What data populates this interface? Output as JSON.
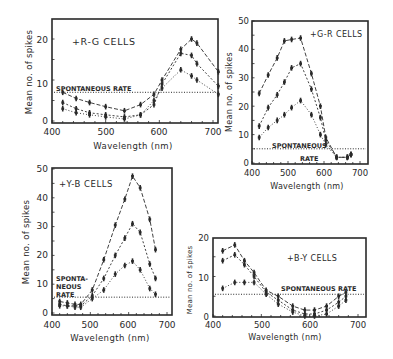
{
  "figure": {
    "panels_count": 4
  },
  "chart_data": [
    {
      "id": "rg",
      "type": "line",
      "title": "+R-G CELLS",
      "xlabel": "Wavelength (nm)",
      "ylabel": "Mean no. of spikes",
      "xlim": [
        400,
        715
      ],
      "ylim": [
        0,
        25
      ],
      "xticks": [
        400,
        500,
        600,
        700
      ],
      "yticks": [
        0,
        10,
        20
      ],
      "grid": false,
      "annotations": [
        "SPONTANEOUS RATE"
      ],
      "spontaneous_rate": 7,
      "x": [
        420,
        445,
        470,
        500,
        535,
        565,
        590,
        605,
        640,
        660,
        670,
        710
      ],
      "series": [
        {
          "name": "high",
          "values": [
            7,
            5.5,
            4.5,
            3.5,
            2.5,
            4,
            6.5,
            10,
            17.5,
            20,
            19,
            12
          ]
        },
        {
          "name": "mid",
          "values": [
            4.5,
            3,
            2,
            1.5,
            1,
            1.5,
            4,
            9,
            16.5,
            16,
            14,
            8.5
          ]
        },
        {
          "name": "low",
          "values": [
            3,
            2,
            1.5,
            1,
            0.5,
            1.5,
            5,
            8,
            12.5,
            11,
            10,
            6.5
          ]
        }
      ]
    },
    {
      "id": "gr",
      "type": "line",
      "title": "+G-R CELLS",
      "xlabel": "Wavelength (nm)",
      "ylabel": "Mean no. of spikes",
      "xlim": [
        400,
        710
      ],
      "ylim": [
        0,
        50
      ],
      "xticks": [
        400,
        500,
        600,
        700
      ],
      "yticks": [
        0,
        10,
        20,
        30,
        40,
        50
      ],
      "grid": false,
      "annotations": [
        "SPONTANEOUS",
        "RATE"
      ],
      "spontaneous_rate": 5,
      "x": [
        420,
        445,
        470,
        490,
        510,
        535,
        565,
        590,
        605,
        635,
        665,
        675
      ],
      "series": [
        {
          "name": "high",
          "values": [
            24.5,
            31,
            37,
            43,
            43.5,
            44,
            31.5,
            20,
            9,
            2,
            2,
            3
          ]
        },
        {
          "name": "mid",
          "values": [
            13,
            19.5,
            24,
            28.5,
            33.5,
            35,
            26,
            16,
            8,
            2,
            2,
            3
          ]
        },
        {
          "name": "low",
          "values": [
            9,
            12.5,
            15,
            17,
            19.5,
            22,
            17,
            10,
            6.5,
            2,
            2,
            3
          ]
        }
      ]
    },
    {
      "id": "yb",
      "type": "line",
      "title": "+Y-B CELLS",
      "xlabel": "Wavelength (nm)",
      "ylabel": "Mean no. of spikes",
      "xlim": [
        400,
        715
      ],
      "ylim": [
        0,
        50
      ],
      "xticks": [
        400,
        500,
        600,
        700
      ],
      "yticks": [
        0,
        10,
        20,
        30,
        40,
        50
      ],
      "grid": false,
      "annotations": [
        "SPONTA-",
        "NEOUS",
        "RATE"
      ],
      "spontaneous_rate": 5.5,
      "x": [
        420,
        440,
        460,
        475,
        505,
        535,
        565,
        590,
        610,
        630,
        655,
        670
      ],
      "series": [
        {
          "name": "high",
          "values": [
            4,
            3.5,
            3,
            3,
            8,
            18.5,
            30.5,
            39.5,
            47.5,
            43.5,
            32.5,
            22
          ]
        },
        {
          "name": "mid",
          "values": [
            3,
            2.5,
            2.5,
            2.5,
            6,
            12,
            20,
            26,
            31,
            28,
            17,
            12
          ]
        },
        {
          "name": "low",
          "values": [
            2.5,
            2.5,
            2,
            2,
            5,
            8,
            13.5,
            16.5,
            18,
            15,
            8.5,
            6.5
          ]
        }
      ]
    },
    {
      "id": "by",
      "type": "line",
      "title": "+B-Y CELLS",
      "xlabel": "Wavelength (nm)",
      "ylabel": "Mean no. of spikes",
      "xlim": [
        400,
        710
      ],
      "ylim": [
        0,
        20
      ],
      "xticks": [
        400,
        500,
        600,
        700
      ],
      "yticks": [
        0,
        10,
        20
      ],
      "grid": false,
      "annotations": [
        "SPONTANEOUS RATE"
      ],
      "spontaneous_rate": 5.5,
      "x": [
        420,
        445,
        465,
        485,
        510,
        535,
        565,
        590,
        610,
        635,
        660,
        675
      ],
      "series": [
        {
          "name": "high",
          "values": [
            16.5,
            18,
            14,
            11,
            6.5,
            5,
            2.5,
            1.5,
            1.5,
            2.5,
            5,
            6
          ]
        },
        {
          "name": "mid",
          "values": [
            14,
            15.5,
            13,
            10,
            6,
            4,
            1.5,
            0.5,
            0.5,
            1.5,
            3.5,
            5
          ]
        },
        {
          "name": "low",
          "values": [
            7,
            8.5,
            8.5,
            8.5,
            5.5,
            3,
            1,
            0,
            0,
            0.5,
            2.5,
            4
          ]
        }
      ]
    }
  ],
  "panels": [
    {
      "title": "+R-G CELLS",
      "xlabel": "Wavelength (nm)",
      "ylabel": "Mean no. of spikes",
      "ann": [
        "SPONTANEOUS RATE"
      ],
      "xt": [
        "400",
        "500",
        "600",
        "700"
      ],
      "yt": [
        "0",
        "10",
        "20"
      ]
    },
    {
      "title": "+G-R CELLS",
      "xlabel": "Wavelength (nm)",
      "ylabel": "Mean no. of spikes",
      "ann": [
        "SPONTANEOUS",
        "RATE"
      ],
      "xt": [
        "400",
        "500",
        "600",
        "700"
      ],
      "yt": [
        "0",
        "10",
        "20",
        "30",
        "40",
        "50"
      ]
    },
    {
      "title": "+Y-B CELLS",
      "xlabel": "Wavelength (nm)",
      "ylabel": "Mean no. of spikes",
      "ann": [
        "SPONTA-",
        "NEOUS",
        "RATE"
      ],
      "xt": [
        "400",
        "500",
        "600",
        "700"
      ],
      "yt": [
        "0",
        "10",
        "20",
        "30",
        "40",
        "50"
      ]
    },
    {
      "title": "+B-Y CELLS",
      "xlabel": "Wavelength (nm)",
      "ylabel": "Mean no. of spikes",
      "ann": [
        "SPONTANEOUS RATE"
      ],
      "xt": [
        "400",
        "500",
        "600",
        "700"
      ],
      "yt": [
        "0",
        "10",
        "20"
      ]
    }
  ],
  "colors": {
    "ink": "#2a2a2a",
    "background": "#ffffff"
  }
}
